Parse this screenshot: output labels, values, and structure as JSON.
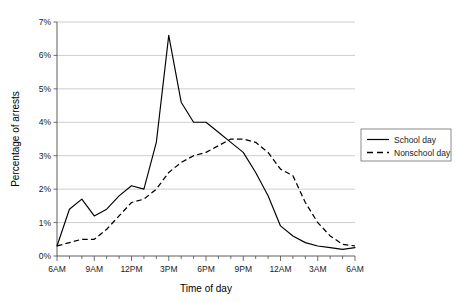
{
  "chart_data": {
    "type": "line",
    "title": "",
    "xlabel": "Time of day",
    "ylabel": "Percentage of arrests",
    "ylim": [
      0,
      7
    ],
    "ytick_labels": [
      "0%",
      "1%",
      "2%",
      "3%",
      "4%",
      "5%",
      "6%",
      "7%"
    ],
    "ytick_values": [
      0,
      1,
      2,
      3,
      4,
      5,
      6,
      7
    ],
    "xtick_labels": [
      "6AM",
      "9AM",
      "12PM",
      "3PM",
      "6PM",
      "9PM",
      "12AM",
      "3AM",
      "6AM"
    ],
    "xtick_values": [
      0,
      3,
      6,
      9,
      12,
      15,
      18,
      21,
      24
    ],
    "x_minor_tick_interval_hours": 1,
    "grid": "horizontal",
    "legend_position": "right-outside",
    "x": [
      0,
      1,
      2,
      3,
      4,
      5,
      6,
      7,
      8,
      9,
      10,
      11,
      12,
      13,
      14,
      15,
      16,
      17,
      18,
      19,
      20,
      21,
      22,
      23,
      24
    ],
    "x_hour_labels": [
      "6AM",
      "7AM",
      "8AM",
      "9AM",
      "10AM",
      "11AM",
      "12PM",
      "1PM",
      "2PM",
      "3PM",
      "4PM",
      "5PM",
      "6PM",
      "7PM",
      "8PM",
      "9PM",
      "10PM",
      "11PM",
      "12AM",
      "1AM",
      "2AM",
      "3AM",
      "4AM",
      "5AM",
      "6AM"
    ],
    "series": [
      {
        "name": "School day",
        "style": "solid",
        "color": "#000000",
        "values": [
          0.3,
          1.4,
          1.7,
          1.2,
          1.4,
          1.8,
          2.1,
          2.0,
          3.4,
          6.6,
          4.6,
          4.0,
          4.0,
          3.7,
          3.4,
          3.1,
          2.5,
          1.8,
          0.9,
          0.6,
          0.4,
          0.3,
          0.25,
          0.2,
          0.25
        ]
      },
      {
        "name": "Nonschool day",
        "style": "dashed",
        "color": "#000000",
        "values": [
          0.3,
          0.4,
          0.5,
          0.5,
          0.8,
          1.2,
          1.6,
          1.7,
          2.0,
          2.5,
          2.8,
          3.0,
          3.1,
          3.3,
          3.5,
          3.5,
          3.4,
          3.1,
          2.6,
          2.4,
          1.6,
          1.0,
          0.6,
          0.35,
          0.3
        ]
      }
    ],
    "annotations": []
  },
  "legend": {
    "items": [
      {
        "label": "School day",
        "style": "solid"
      },
      {
        "label": "Nonschool day",
        "style": "dashed"
      }
    ]
  },
  "axes": {
    "x_title": "Time of day",
    "y_title": "Percentage of arrests"
  }
}
